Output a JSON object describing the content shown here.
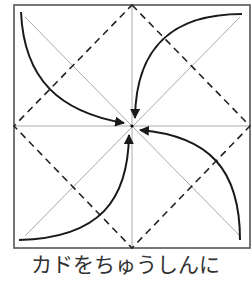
{
  "diagram": {
    "square": {
      "x1": 14,
      "y1": 5,
      "x2": 250,
      "y2": 248
    },
    "center": {
      "x": 132,
      "y": 126
    },
    "colors": {
      "border": "#555555",
      "crease": "#aaaaaa",
      "dashed": "#222222",
      "arrow": "#1a1a1a",
      "center_dot": "#000000"
    },
    "arrows": [
      {
        "from": "top-left corner",
        "to": "center"
      },
      {
        "from": "top-right corner",
        "to": "center"
      },
      {
        "from": "bottom-right corner",
        "to": "center"
      },
      {
        "from": "bottom-left corner",
        "to": "center"
      }
    ]
  },
  "caption": "カドをちゅうしんに"
}
